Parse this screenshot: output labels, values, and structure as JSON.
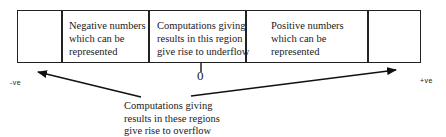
{
  "diagram": {
    "regions": [
      {
        "id": "neg-overflow",
        "label": ""
      },
      {
        "id": "neg-representable",
        "label": "Negative numbers\nwhich can be\nrepresented"
      },
      {
        "id": "underflow",
        "label": "Computations giving\nresults in this region\ngive rise to underflow"
      },
      {
        "id": "pos-representable",
        "label": "Positive numbers\nwhich can be\nrepresented"
      },
      {
        "id": "pos-overflow",
        "label": ""
      }
    ],
    "axis": {
      "negative_label": "-ve",
      "positive_label": "+ve",
      "zero_label": "0"
    },
    "overflow_caption": "Computations giving\nresults in these regions\ngive rise to overflow"
  }
}
